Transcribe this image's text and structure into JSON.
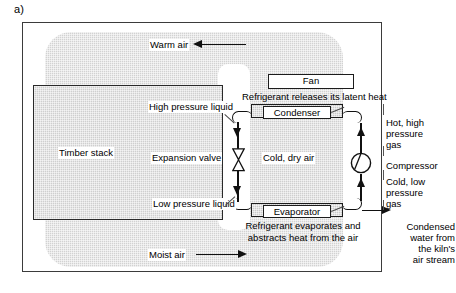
{
  "figure": {
    "label": "a)"
  },
  "kiln": {
    "timber_stack_label": "Timber stack",
    "warm_air_label": "Warm air",
    "moist_air_label": "Moist air",
    "cold_dry_air_label": "Cold, dry air"
  },
  "components": {
    "fan": "Fan",
    "condenser": "Condenser",
    "evaporator": "Evaporator",
    "compressor": "Compressor",
    "expansion_valve": "Expansion valve"
  },
  "refrigerant_states": {
    "high_pressure_liquid": "High pressure liquid",
    "low_pressure_liquid": "Low pressure liquid",
    "hot_high_pressure_gas": "Hot, high\npressure\ngas",
    "cold_low_pressure_gas": "Cold, low\npressure\ngas"
  },
  "annotations": {
    "condenser_note": "Refrigerant releases its latent heat",
    "evaporator_note": "Refrigerant evaporates and\nabstracts heat from the air",
    "condensate_note": "Condensed\nwater from\nthe kiln's\nair stream"
  },
  "icons": {
    "expansion_valve": "bowtie-valve-icon",
    "compressor": "compressor-circle-icon",
    "warm_air_arrow": "arrow-left-icon",
    "moist_air_arrow": "arrow-right-icon",
    "condensate_arrow": "arrow-right-icon"
  },
  "colors": {
    "outline": "#1c1c1c",
    "frame": "#3b3b3b",
    "air_shade": "#d2d2d2",
    "component_shade": "#cacaca",
    "background": "#ffffff"
  }
}
